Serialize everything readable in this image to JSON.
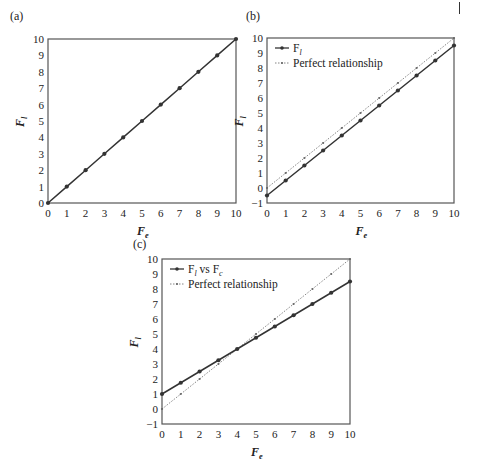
{
  "page": {
    "corner_mark": "I"
  },
  "chart_data": [
    {
      "type": "line",
      "panel_label": "(a)",
      "title": "",
      "xlabel": "F_e",
      "ylabel": "F_l",
      "xlim": [
        0,
        10
      ],
      "ylim": [
        0,
        10
      ],
      "xticks": [
        0,
        1,
        2,
        3,
        4,
        5,
        6,
        7,
        8,
        9,
        10
      ],
      "yticks": [
        0,
        1,
        2,
        3,
        4,
        5,
        6,
        7,
        8,
        9,
        10
      ],
      "grid": false,
      "legend": null,
      "x": [
        0,
        1,
        2,
        3,
        4,
        5,
        6,
        7,
        8,
        9,
        10
      ],
      "series": [
        {
          "name": "F_l",
          "style": "solid-dot",
          "values": [
            0,
            1,
            2,
            3,
            4,
            5,
            6,
            7,
            8,
            9,
            10
          ]
        }
      ]
    },
    {
      "type": "line",
      "panel_label": "(b)",
      "title": "",
      "xlabel": "F_e",
      "ylabel": "F_l",
      "xlim": [
        0,
        10
      ],
      "ylim": [
        -1,
        10
      ],
      "xticks": [
        0,
        1,
        2,
        3,
        4,
        5,
        6,
        7,
        8,
        9,
        10
      ],
      "yticks": [
        -1,
        0,
        1,
        2,
        3,
        4,
        5,
        6,
        7,
        8,
        9,
        10
      ],
      "grid": false,
      "legend": {
        "position": "upper-left",
        "entries": [
          "F_l",
          "Perfect relationship"
        ]
      },
      "x": [
        0,
        1,
        2,
        3,
        4,
        5,
        6,
        7,
        8,
        9,
        10
      ],
      "series": [
        {
          "name": "F_l",
          "style": "solid-dot",
          "values": [
            -0.5,
            0.5,
            1.5,
            2.5,
            3.5,
            4.5,
            5.5,
            6.5,
            7.5,
            8.5,
            9.5
          ]
        },
        {
          "name": "Perfect relationship",
          "style": "dotted-dot",
          "values": [
            0,
            1,
            2,
            3,
            4,
            5,
            6,
            7,
            8,
            9,
            10
          ]
        }
      ]
    },
    {
      "type": "line",
      "panel_label": "(c)",
      "title": "",
      "xlabel": "F_e",
      "ylabel": "F_l",
      "xlim": [
        0,
        10
      ],
      "ylim": [
        -1,
        10
      ],
      "xticks": [
        0,
        1,
        2,
        3,
        4,
        5,
        6,
        7,
        8,
        9,
        10
      ],
      "yticks": [
        -1,
        0,
        1,
        2,
        3,
        4,
        5,
        6,
        7,
        8,
        9,
        10
      ],
      "grid": false,
      "legend": {
        "position": "upper-left",
        "entries": [
          "F_l vs F_c",
          "Perfect relationship"
        ]
      },
      "x": [
        0,
        1,
        2,
        3,
        4,
        5,
        6,
        7,
        8,
        9,
        10
      ],
      "series": [
        {
          "name": "F_l vs F_c",
          "style": "solid-dot",
          "values": [
            1,
            1.75,
            2.5,
            3.25,
            4,
            4.75,
            5.5,
            6.25,
            7,
            7.75,
            8.5
          ]
        },
        {
          "name": "Perfect relationship",
          "style": "dotted-dot",
          "values": [
            0,
            1,
            2,
            3,
            4,
            5,
            6,
            7,
            8,
            9,
            10
          ]
        }
      ]
    }
  ],
  "layout": {
    "panels": [
      {
        "left": 48,
        "top": 39,
        "right": 236,
        "bottom": 203,
        "label_x": 10,
        "label_y": 20
      },
      {
        "left": 267,
        "top": 38,
        "right": 454,
        "bottom": 203,
        "label_x": 246,
        "label_y": 20
      },
      {
        "left": 162,
        "top": 259,
        "right": 350,
        "bottom": 424,
        "label_x": 133,
        "label_y": 248
      }
    ],
    "colors": {
      "axis": "#555555",
      "solid": "#333333",
      "dotted": "#666666",
      "text": "#222222"
    }
  }
}
